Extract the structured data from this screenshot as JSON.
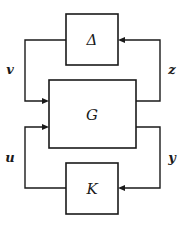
{
  "diagram": {
    "type": "block-diagram",
    "blocks": {
      "uncertainty": {
        "label": "Δ"
      },
      "plant": {
        "label": "G"
      },
      "controller": {
        "label": "K"
      }
    },
    "signals": {
      "v": {
        "label": "v",
        "from": "Δ",
        "to": "G"
      },
      "z": {
        "label": "z",
        "from": "G",
        "to": "Δ"
      },
      "u": {
        "label": "u",
        "from": "K",
        "to": "G"
      },
      "y": {
        "label": "y",
        "from": "G",
        "to": "K"
      }
    }
  }
}
